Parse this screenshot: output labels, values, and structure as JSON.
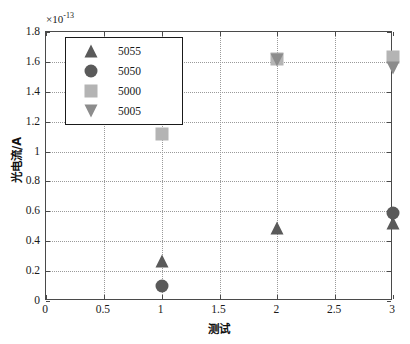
{
  "chart_data": {
    "type": "scatter",
    "title": "",
    "xlabel": "测试",
    "ylabel": "光电流/A",
    "y_exponent_prefix": "×10",
    "y_exponent_power": "-13",
    "xlim": [
      0,
      3
    ],
    "ylim": [
      0,
      1.8
    ],
    "xticks": [
      "0",
      "0.5",
      "1",
      "1.5",
      "2",
      "2.5",
      "3"
    ],
    "xtick_values": [
      0,
      0.5,
      1,
      1.5,
      2,
      2.5,
      3
    ],
    "yticks": [
      "0",
      "0.2",
      "0.4",
      "0.6",
      "0.8",
      "1",
      "1.2",
      "1.4",
      "1.6",
      "1.8"
    ],
    "ytick_values": [
      0,
      0.2,
      0.4,
      0.6,
      0.8,
      1.0,
      1.2,
      1.4,
      1.6,
      1.8
    ],
    "grid": true,
    "grid_style": "dotted",
    "legend_position": "upper left",
    "series": [
      {
        "name": "5055",
        "marker": "triangle-up",
        "color": "#5a5a5a",
        "x": [
          1,
          2,
          3
        ],
        "values": [
          0.27,
          0.49,
          0.52
        ]
      },
      {
        "name": "5050",
        "marker": "circle",
        "color": "#5a5a5a",
        "x": [
          1,
          3
        ],
        "values": [
          0.1,
          0.59
        ]
      },
      {
        "name": "5000",
        "marker": "square",
        "color": "#b4b4b4",
        "x": [
          1,
          2,
          3
        ],
        "values": [
          1.12,
          1.62,
          1.63
        ]
      },
      {
        "name": "5005",
        "marker": "triangle-down",
        "color": "#8c8c8c",
        "x": [
          1,
          2,
          3
        ],
        "values": [
          1.22,
          1.61,
          1.56
        ]
      }
    ]
  },
  "legend": {
    "entries": [
      {
        "label": "5055",
        "marker": "triangle-up-icon"
      },
      {
        "label": "5050",
        "marker": "circle-icon"
      },
      {
        "label": "5000",
        "marker": "square-icon"
      },
      {
        "label": "5005",
        "marker": "triangle-down-icon"
      }
    ]
  },
  "colors": {
    "axis": "#4a4a4a",
    "grid": "#9a9a9a",
    "background": "#ffffff",
    "dark_gray": "#5a5a5a",
    "mid_gray": "#8c8c8c",
    "light_gray": "#b4b4b4"
  }
}
